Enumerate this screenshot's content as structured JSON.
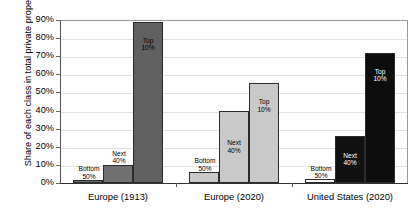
{
  "chart_data": {
    "type": "bar",
    "title": "",
    "xlabel": "",
    "ylabel": "Share of each class in total private property",
    "ylim": [
      0,
      90
    ],
    "ytick_labels": [
      "0%",
      "10%",
      "20%",
      "30%",
      "40%",
      "50%",
      "60%",
      "70%",
      "80%",
      "90%"
    ],
    "ytick_values": [
      0,
      10,
      20,
      30,
      40,
      50,
      60,
      70,
      80,
      90
    ],
    "grid": true,
    "legend": "none",
    "categories": [
      "Europe (1913)",
      "Europe (2020)",
      "United States (2020)"
    ],
    "series": [
      {
        "name": "Bottom 50%",
        "values": [
          1.5,
          6,
          2
        ]
      },
      {
        "name": "Next 40%",
        "values": [
          10,
          40,
          26
        ]
      },
      {
        "name": "Top 10%",
        "values": [
          89,
          55,
          72
        ]
      }
    ],
    "bar_labels": [
      [
        "Bottom\n50%",
        "Next\n40%",
        "Top\n10%"
      ],
      [
        "Bottom\n50%",
        "Next\n40%",
        "Top\n10%"
      ],
      [
        "Bottom\n50%",
        "Next\n40%",
        "Top\n10%"
      ]
    ],
    "colors": {
      "group1": [
        "#6f6f6f",
        "#707070",
        "#606060"
      ],
      "group2": [
        "#c9c9c9",
        "#c9c9c9",
        "#c9c9c9"
      ],
      "group3": [
        "#ffffff",
        "#111111",
        "#0d0d0d"
      ]
    },
    "label_colors": {
      "group1": [
        "#000000",
        "#000000",
        "#000000"
      ],
      "group2": [
        "#000000",
        "#000000",
        "#000000"
      ],
      "group3": [
        "#000000",
        "#ffffff",
        "#ffffff"
      ]
    }
  }
}
